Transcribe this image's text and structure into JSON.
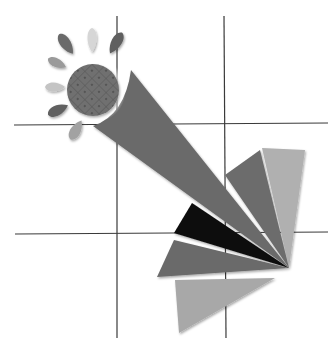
{
  "illustration": {
    "title": "Sun with fan of triangular rays over grid",
    "background": "#ffffff",
    "grid": {
      "color": "#3a3a3a",
      "vertical_x": [
        117,
        224
      ],
      "vertical_range": [
        16,
        338
      ],
      "horizontal_y": [
        125,
        233
      ],
      "horizontal_range": [
        14,
        328
      ]
    },
    "sun": {
      "center": [
        93,
        90
      ],
      "radius": 26,
      "fill": "#6e6e6e",
      "pattern": "diamond-lattice",
      "petals": [
        {
          "cx": 66,
          "cy": 44,
          "angle": -35,
          "fill": "#6a6a6a"
        },
        {
          "cx": 92,
          "cy": 40,
          "angle": 0,
          "fill": "#d6d6d6"
        },
        {
          "cx": 116,
          "cy": 43,
          "angle": 30,
          "fill": "#5e5e5e"
        },
        {
          "cx": 57,
          "cy": 63,
          "angle": -65,
          "fill": "#9a9a9a"
        },
        {
          "cx": 55,
          "cy": 87,
          "angle": -90,
          "fill": "#c4c4c4"
        },
        {
          "cx": 58,
          "cy": 110,
          "angle": -115,
          "fill": "#606060"
        },
        {
          "cx": 76,
          "cy": 130,
          "angle": -150,
          "fill": "#a2a2a2"
        }
      ]
    },
    "rays": [
      {
        "name": "big-ray",
        "fill": "#6b6b6b",
        "points": "131,70 289,268 93,126"
      },
      {
        "name": "lightest-ray",
        "fill": "#b0b0b0",
        "points": "262,148 305,150 289,268"
      },
      {
        "name": "mid-ray",
        "fill": "#6c6c6c",
        "points": "225,175 258,150 289,268"
      },
      {
        "name": "black-ray",
        "fill": "#111111",
        "points": "192,203 289,268 174,233"
      },
      {
        "name": "dark-gray-ray",
        "fill": "#6a6a6a",
        "points": "174,240 289,268 157,277"
      },
      {
        "name": "light-bottom-ray",
        "fill": "#a8a8a8",
        "points": "175,280 275,278 179,333"
      }
    ]
  }
}
